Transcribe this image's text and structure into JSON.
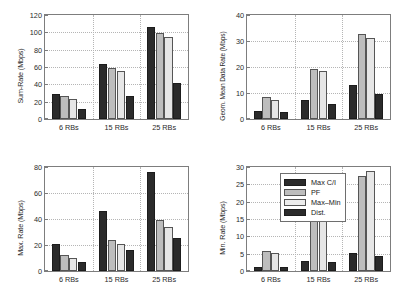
{
  "figure": {
    "background": "#ffffff",
    "bar_colors": [
      "#2b2b2b",
      "#bdbdbd",
      "#e6e6e6",
      "#2b2b2b"
    ],
    "axis_color": "#7d7d7d",
    "grid_color": "#b5b5b5"
  },
  "legend": {
    "position": "top-left of bottom-right panel",
    "entries": [
      {
        "label": "Max C/I",
        "color": "#2b2b2b"
      },
      {
        "label": "PF",
        "color": "#bdbdbd"
      },
      {
        "label": "Max–Min",
        "color": "#ececec"
      },
      {
        "label": "Dist.",
        "color": "#2b2b2b"
      }
    ]
  },
  "chart_data": [
    {
      "type": "bar",
      "panel": "top-left",
      "title": "",
      "xlabel": "",
      "ylabel": "Sum-Rate (Mbps)",
      "categories": [
        "6 RBs",
        "15 RBs",
        "25 RBs"
      ],
      "yticks": [
        0,
        20,
        40,
        60,
        80,
        100,
        120
      ],
      "ylim": [
        0,
        120
      ],
      "grid": true,
      "series": [
        {
          "name": "Max C/I",
          "values": [
            28.5,
            63.8,
            106.0
          ]
        },
        {
          "name": "PF",
          "values": [
            26.5,
            59.3,
            99.5
          ]
        },
        {
          "name": "Max–Min",
          "values": [
            23.0,
            55.3,
            94.5
          ]
        },
        {
          "name": "Dist.",
          "values": [
            11.5,
            26.0,
            41.5
          ]
        }
      ]
    },
    {
      "type": "bar",
      "panel": "top-right",
      "title": "",
      "xlabel": "",
      "ylabel": "Geom. Mean Data Rate (Mbps)",
      "categories": [
        "6 RBs",
        "15 RBs",
        "25 RBs"
      ],
      "yticks": [
        0,
        10,
        20,
        30,
        40
      ],
      "ylim": [
        0,
        40
      ],
      "grid": true,
      "series": [
        {
          "name": "Max C/I",
          "values": [
            3.0,
            7.3,
            13.2
          ]
        },
        {
          "name": "PF",
          "values": [
            8.6,
            19.4,
            32.7
          ]
        },
        {
          "name": "Max–Min",
          "values": [
            7.5,
            18.4,
            31.3
          ]
        },
        {
          "name": "Dist.",
          "values": [
            2.6,
            5.7,
            9.6
          ]
        }
      ]
    },
    {
      "type": "bar",
      "panel": "bottom-left",
      "title": "",
      "xlabel": "",
      "ylabel": "Max. Rate (Mbps)",
      "categories": [
        "6 RBs",
        "15 RBs",
        "25 RBs"
      ],
      "yticks": [
        0,
        20,
        40,
        60,
        80
      ],
      "ylim": [
        0,
        80
      ],
      "grid": true,
      "series": [
        {
          "name": "Max C/I",
          "values": [
            21.0,
            46.0,
            76.0
          ]
        },
        {
          "name": "PF",
          "values": [
            12.0,
            24.0,
            39.0
          ]
        },
        {
          "name": "Max–Min",
          "values": [
            10.0,
            20.5,
            34.0
          ]
        },
        {
          "name": "Dist.",
          "values": [
            7.2,
            16.3,
            25.5
          ]
        }
      ]
    },
    {
      "type": "bar",
      "panel": "bottom-right",
      "title": "",
      "xlabel": "",
      "ylabel": "Min. Rate (Mbps)",
      "categories": [
        "6 RBs",
        "15 RBs",
        "25 RBs"
      ],
      "yticks": [
        0,
        5,
        10,
        15,
        20,
        25,
        30
      ],
      "ylim": [
        0,
        30
      ],
      "grid": true,
      "series": [
        {
          "name": "Max C/I",
          "values": [
            1.2,
            3.0,
            5.3
          ]
        },
        {
          "name": "PF",
          "values": [
            5.9,
            15.7,
            27.5
          ]
        },
        {
          "name": "Max–Min",
          "values": [
            5.2,
            16.0,
            28.8
          ]
        },
        {
          "name": "Dist.",
          "values": [
            1.2,
            2.5,
            4.4
          ]
        }
      ]
    }
  ]
}
